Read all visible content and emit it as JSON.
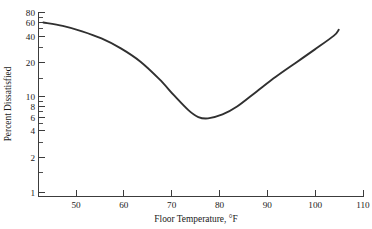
{
  "chart_data": {
    "type": "line",
    "title": "",
    "xlabel": "Floor Temperature, °F",
    "ylabel": "Percent Dissatisfied",
    "xlim": [
      43,
      110
    ],
    "ylim": [
      1,
      85
    ],
    "yscale": "log",
    "xscale": "linear",
    "grid": false,
    "legend": null,
    "xticks": [
      50,
      60,
      70,
      80,
      90,
      100,
      110
    ],
    "xtick_labels": [
      "50",
      "60",
      "70",
      "80",
      "90",
      "100",
      "110"
    ],
    "yticks": [
      1,
      2,
      4,
      6,
      8,
      10,
      20,
      40,
      60,
      80
    ],
    "ytick_labels": [
      "1",
      "2",
      "4",
      "6",
      "8",
      "10",
      "20",
      "40",
      "60",
      "80"
    ],
    "yminor_ticks": [
      3,
      5,
      7,
      9,
      30,
      50,
      70
    ],
    "series": [
      {
        "name": "Percent Dissatisfied",
        "x": [
          44,
          48,
          52,
          56,
          60,
          64,
          68,
          71,
          74,
          76,
          78,
          81,
          84,
          88,
          92,
          96,
          100,
          104,
          105
        ],
        "y": [
          62,
          57,
          50,
          42,
          33,
          24,
          15.5,
          10.5,
          7.3,
          6.2,
          6.0,
          6.6,
          8.0,
          11.5,
          16.5,
          23,
          32,
          45,
          52
        ]
      }
    ],
    "annotations": []
  },
  "axis": {
    "x_title": "Floor Temperature, °F",
    "y_title": "Percent Dissatisfied"
  }
}
